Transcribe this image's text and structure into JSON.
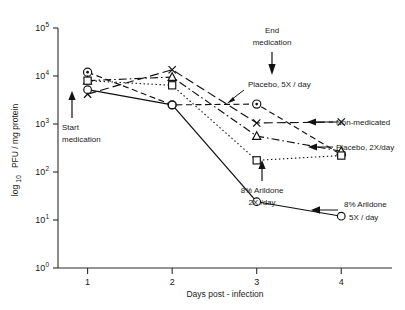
{
  "chart_data": {
    "type": "line",
    "title": "",
    "xlabel": "Days post - infection",
    "ylabel": "log 10 PFU / mg protein",
    "ylabel_main": "PFU / mg protein",
    "ylabel_prefix": "log",
    "ylabel_sub": "10",
    "x": [
      1,
      2,
      3,
      4
    ],
    "xtick_labels": [
      "1",
      "2",
      "3",
      "4"
    ],
    "xlim": [
      0.65,
      4.6
    ],
    "ylim": [
      1,
      100000
    ],
    "yscale": "log",
    "ytick_values": [
      1,
      10,
      100,
      1000,
      10000,
      100000
    ],
    "ytick_labels": [
      "10",
      "10",
      "10",
      "10",
      "10",
      "10"
    ],
    "ytick_exponents": [
      "0",
      "1",
      "2",
      "3",
      "4",
      "5"
    ],
    "grid": false,
    "legend_position": "inline-callouts",
    "series": [
      {
        "name": "Placebo, 5X / day",
        "marker": "circle-dot",
        "linestyle": "dashed",
        "values": [
          12000,
          2500,
          2600,
          230
        ]
      },
      {
        "name": "Non-medicated",
        "marker": "x",
        "linestyle": "dash-long",
        "values": [
          4200,
          13500,
          1050,
          1100
        ]
      },
      {
        "name": "Placebo, 2X/day",
        "marker": "triangle",
        "linestyle": "dash-dot",
        "values": [
          8000,
          9500,
          560,
          270
        ]
      },
      {
        "name": "8% Arildone 2X / day",
        "marker": "square",
        "linestyle": "dotted",
        "values": [
          8000,
          6400,
          175,
          220
        ]
      },
      {
        "name": "8% Arildone 5X / day",
        "marker": "circle",
        "linestyle": "solid",
        "values": [
          5200,
          2500,
          24,
          12
        ]
      }
    ],
    "annotations": [
      {
        "id": "start-medication",
        "text_line1": "Start",
        "text_line2": "medication",
        "direction": "up",
        "at_x": 1
      },
      {
        "id": "end-medication",
        "text_line1": "End",
        "text_line2": "medication",
        "direction": "down",
        "at_x": 3
      }
    ],
    "callouts": [
      {
        "id": "placebo-5x",
        "text": "Placebo, 5X / day"
      },
      {
        "id": "non-medicated",
        "text": "Non-medicated"
      },
      {
        "id": "placebo-2x",
        "text": "Placebo, 2X/day"
      },
      {
        "id": "arildone-2x-line1",
        "text": "8% Arildone"
      },
      {
        "id": "arildone-2x-line2",
        "text": "2X /day"
      },
      {
        "id": "arildone-5x-line1",
        "text": "8% Arildone"
      },
      {
        "id": "arildone-5x-line2",
        "text": "5X / day"
      }
    ]
  },
  "colors": {
    "ink": "#111111",
    "axis": "#2b2b2b",
    "background": "#ffffff"
  }
}
